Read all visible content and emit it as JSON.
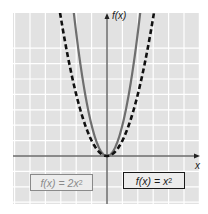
{
  "chart_data": {
    "type": "line",
    "title": "",
    "xlabel": "x",
    "ylabel": "f(x)",
    "grid": true,
    "xlim": [
      -6.2,
      6.0
    ],
    "ylim": [
      -3.1,
      9.3
    ],
    "series": [
      {
        "name": "f(x) = 2x²",
        "style": "solid",
        "color": "#6e6e6e",
        "x": [
          -2.2,
          -2,
          -1.5,
          -1,
          -0.5,
          0,
          0.5,
          1,
          1.5,
          2,
          2.2
        ],
        "y": [
          9.68,
          8,
          4.5,
          2,
          0.5,
          0,
          0.5,
          2,
          4.5,
          8,
          9.68
        ]
      },
      {
        "name": "f(x) = x²",
        "style": "dashed",
        "color": "#111111",
        "x": [
          -3.05,
          -3,
          -2,
          -1,
          0,
          1,
          2,
          3,
          3.05
        ],
        "y": [
          9.3,
          9,
          4,
          1,
          0,
          1,
          4,
          9,
          9.3
        ]
      }
    ],
    "legend": [
      {
        "label": "f(x) = 2x",
        "exp": "2",
        "color": "#8a8a8a",
        "position": "bottom-left"
      },
      {
        "label": "f(x) = x",
        "exp": "2",
        "color": "#1a1a1a",
        "position": "bottom-right"
      }
    ]
  },
  "axes": {
    "x_label": "x",
    "y_label": "f(x)"
  },
  "colors": {
    "grid_bg": "#e2e2e2",
    "grid_line": "#ffffff",
    "axis": "#222222"
  }
}
